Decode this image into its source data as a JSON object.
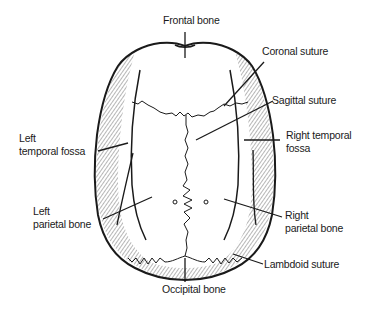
{
  "diagram": {
    "colors": {
      "ink": "#1a1a1a",
      "background": "#ffffff",
      "hatch": "#555555"
    },
    "labels": {
      "frontal_bone": "Frontal bone",
      "coronal_suture": "Coronal suture",
      "sagittal_suture": "Sagittal suture",
      "left_temporal_fossa_line1": "Left",
      "left_temporal_fossa_line2": "temporal fossa",
      "right_temporal_fossa_line1": "Right temporal",
      "right_temporal_fossa_line2": "fossa",
      "left_parietal_bone_line1": "Left",
      "left_parietal_bone_line2": "parietal bone",
      "right_parietal_bone_line1": "Right",
      "right_parietal_bone_line2": "parietal bone",
      "lambdoid_suture": "Lambdoid suture",
      "occipital_bone": "Occipital bone"
    }
  }
}
